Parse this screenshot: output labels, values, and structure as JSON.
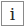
{
  "info_button": {
    "icon": "info-icon",
    "glyph": "i",
    "colors": {
      "border": "#8a8a8a",
      "glyph": "#222222",
      "background": "#ffffff"
    }
  }
}
